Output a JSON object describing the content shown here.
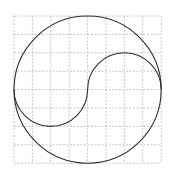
{
  "diagram": {
    "type": "geometry-figure",
    "grid": {
      "rows": 8,
      "cols": 8,
      "origin_px": [
        14,
        16
      ],
      "cell_px": 18.4,
      "line_style": "dashed",
      "line_color": "#b8b8b8"
    },
    "outer_circle": {
      "center_grid": [
        4,
        4
      ],
      "radius_cells": 4,
      "stroke_color": "#2e2e2e"
    },
    "s_curve": {
      "upper_right_semicircle": {
        "center_grid": [
          6,
          4
        ],
        "radius_cells": 2,
        "bulge": "up"
      },
      "lower_left_semicircle": {
        "center_grid": [
          2,
          4
        ],
        "radius_cells": 2,
        "bulge": "down"
      },
      "stroke_color": "#2e2e2e"
    }
  }
}
